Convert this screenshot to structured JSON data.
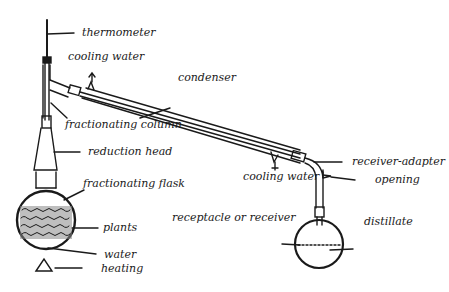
{
  "diagram": {
    "type": "distillation-apparatus",
    "labels": {
      "thermometer": "thermometer",
      "cooling_water_top": "cooling water",
      "condenser": "condenser",
      "fractionating_column": "fractionating column",
      "reduction_head": "reduction head",
      "fractionating_flask": "fractionating flask",
      "plants": "plants",
      "water": "water",
      "heating": "heating",
      "receiver_adapter": "receiver-adapter",
      "opening": "opening",
      "cooling_water_bottom": "cooling water",
      "receptacle": "receptacle or receiver",
      "distillate": "distillate"
    },
    "colors": {
      "ink": "#1a1a1a",
      "background": "#ffffff"
    }
  }
}
